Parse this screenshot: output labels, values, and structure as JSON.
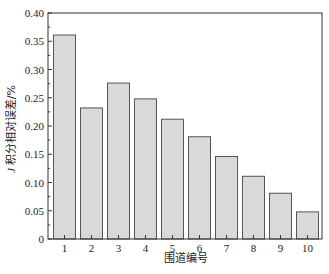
{
  "chart_data": {
    "type": "bar",
    "title": "",
    "xlabel": "围道编号",
    "ylabel": "J 积分相对误差/%",
    "ylabel_italic_prefix": "J",
    "ylabel_rest": "积分相对误差/%",
    "categories": [
      "1",
      "2",
      "3",
      "4",
      "5",
      "6",
      "7",
      "8",
      "9",
      "10"
    ],
    "values": [
      0.361,
      0.232,
      0.276,
      0.248,
      0.212,
      0.181,
      0.146,
      0.111,
      0.081,
      0.048
    ],
    "ylim": [
      0,
      0.4
    ],
    "yticks": [
      "0",
      "0.05",
      "0.10",
      "0.15",
      "0.20",
      "0.25",
      "0.30",
      "0.35",
      "0.40"
    ],
    "grid": false,
    "legend": null,
    "colors": {
      "bar_fill": "#d9d9d9",
      "bar_edge": "#555555",
      "axis": "#333333"
    }
  }
}
